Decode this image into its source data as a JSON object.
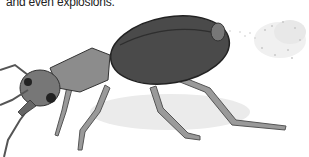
{
  "caption": {
    "text": "and even explosions."
  },
  "illustration": {
    "subject": "bombardier beetle spraying",
    "colors": {
      "body": "#4a4a4a",
      "body_dark": "#2e2e2e",
      "legs": "#8a8a8a",
      "shadow": "#e6e6e6",
      "spray": "#bdbdbd"
    }
  }
}
